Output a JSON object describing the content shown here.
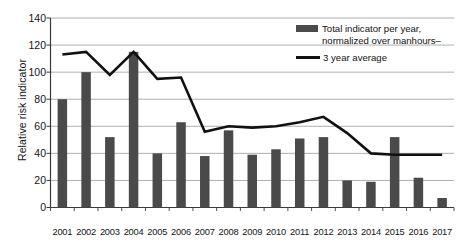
{
  "chart_data": {
    "type": "bar",
    "title": "",
    "xlabel": "",
    "ylabel": "Relative risk indicator",
    "ylim": [
      0,
      140
    ],
    "yticks": [
      0,
      20,
      40,
      60,
      80,
      100,
      120,
      140
    ],
    "grid": true,
    "legend_position": "top-right",
    "categories": [
      "2001",
      "2002",
      "2003",
      "2004",
      "2005",
      "2006",
      "2007",
      "2008",
      "2009",
      "2010",
      "2011",
      "2012",
      "2013",
      "2014",
      "2015",
      "2016",
      "2017"
    ],
    "series": [
      {
        "name": "Total indicator per year, normalized over manhours",
        "type": "bar",
        "color": "#4a4a4a",
        "values": [
          80,
          100,
          52,
          115,
          40,
          63,
          38,
          57,
          39,
          43,
          51,
          52,
          20,
          19,
          52,
          22,
          7
        ]
      },
      {
        "name": "3 year average",
        "type": "line",
        "color": "#111111",
        "values": [
          113,
          115,
          98,
          115,
          95,
          96,
          56,
          60,
          59,
          60,
          63,
          67,
          55,
          40,
          39,
          39,
          39
        ]
      }
    ]
  },
  "legend": {
    "bar_label": "Total indicator per year,\nnormalized over manhours–",
    "line_label": "3 year average"
  },
  "axis": {
    "y_title": "Relative risk indicator"
  }
}
